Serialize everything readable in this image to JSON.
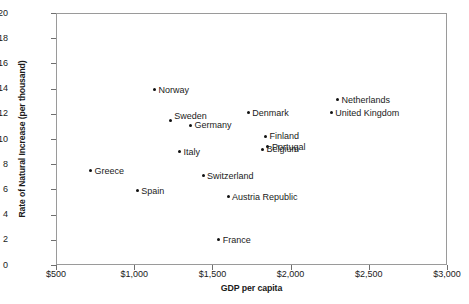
{
  "chart_data": {
    "type": "scatter",
    "title": "",
    "xlabel": "GDP per capita",
    "ylabel": "Rate of Natural Increase (per thousand)",
    "xlim": [
      500,
      3000
    ],
    "ylim": [
      0,
      20
    ],
    "xticks": [
      500,
      1000,
      1500,
      2000,
      2500,
      3000
    ],
    "xtick_labels": [
      "$500",
      "$1,000",
      "$1,500",
      "$2,000",
      "$2,500",
      "$3,000"
    ],
    "yticks": [
      0,
      2,
      4,
      6,
      8,
      10,
      12,
      14,
      16,
      18,
      20
    ],
    "ytick_labels": [
      "0",
      "2",
      "4",
      "6",
      "8",
      "10",
      "12",
      "14",
      "16",
      "18",
      "20"
    ],
    "grid": false,
    "legend": false,
    "marker_color": "#111111",
    "frame_color": "#9a9a9a",
    "points": [
      {
        "label": "Norway",
        "x": 1130,
        "y": 13.9,
        "label_side": "right"
      },
      {
        "label": "Sweden",
        "x": 1230,
        "y": 11.5,
        "label_side": "right-up"
      },
      {
        "label": "Germany",
        "x": 1360,
        "y": 11.1,
        "label_side": "right"
      },
      {
        "label": "Denmark",
        "x": 1730,
        "y": 12.1,
        "label_side": "right"
      },
      {
        "label": "Netherlands",
        "x": 2300,
        "y": 13.1,
        "label_side": "right"
      },
      {
        "label": "United Kingdom",
        "x": 2260,
        "y": 12.1,
        "label_side": "right"
      },
      {
        "label": "Finland",
        "x": 1840,
        "y": 10.2,
        "label_side": "right"
      },
      {
        "label": "Portugal",
        "x": 1855,
        "y": 9.4,
        "label_side": "right"
      },
      {
        "label": "Italy",
        "x": 1290,
        "y": 9.0,
        "label_side": "right"
      },
      {
        "label": "Belgium",
        "x": 1820,
        "y": 9.2,
        "label_side": "right"
      },
      {
        "label": "Greece",
        "x": 720,
        "y": 7.5,
        "label_side": "right"
      },
      {
        "label": "Switzerland",
        "x": 1440,
        "y": 7.1,
        "label_side": "right"
      },
      {
        "label": "Spain",
        "x": 1020,
        "y": 5.9,
        "label_side": "right"
      },
      {
        "label": "Austria Republic",
        "x": 1600,
        "y": 5.4,
        "label_side": "right"
      },
      {
        "label": "France",
        "x": 1540,
        "y": 2.0,
        "label_side": "right"
      }
    ]
  }
}
